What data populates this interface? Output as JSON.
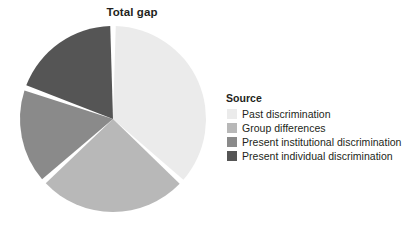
{
  "chart_data": {
    "type": "pie",
    "title": "Total gap",
    "legend_title": "Source",
    "legend_position": "right",
    "categories": [
      "Past discrimination",
      "Group differences",
      "Present institutional discrimination",
      "Present individual discrimination"
    ],
    "values": [
      36.8,
      26.5,
      17.1,
      19.6
    ],
    "units": "percent",
    "colors": [
      "#ebebeb",
      "#b8b8b8",
      "#8a8a8a",
      "#555555"
    ],
    "start_angle_deg": 0,
    "direction": "clockwise",
    "slice_boundaries_deg": [
      0,
      132.5,
      228,
      289.5,
      360
    ],
    "separator_color": "#ffffff",
    "xlabel": "",
    "ylabel": "",
    "grid": false,
    "background": "#ffffff"
  },
  "figure": {
    "title": "Total gap"
  },
  "legend": {
    "title": "Source",
    "items": [
      {
        "label": "Past discrimination",
        "color": "#ebebeb"
      },
      {
        "label": "Group differences",
        "color": "#b8b8b8"
      },
      {
        "label": "Present institutional discrimination",
        "color": "#8a8a8a"
      },
      {
        "label": "Present individual discrimination",
        "color": "#555555"
      }
    ]
  }
}
